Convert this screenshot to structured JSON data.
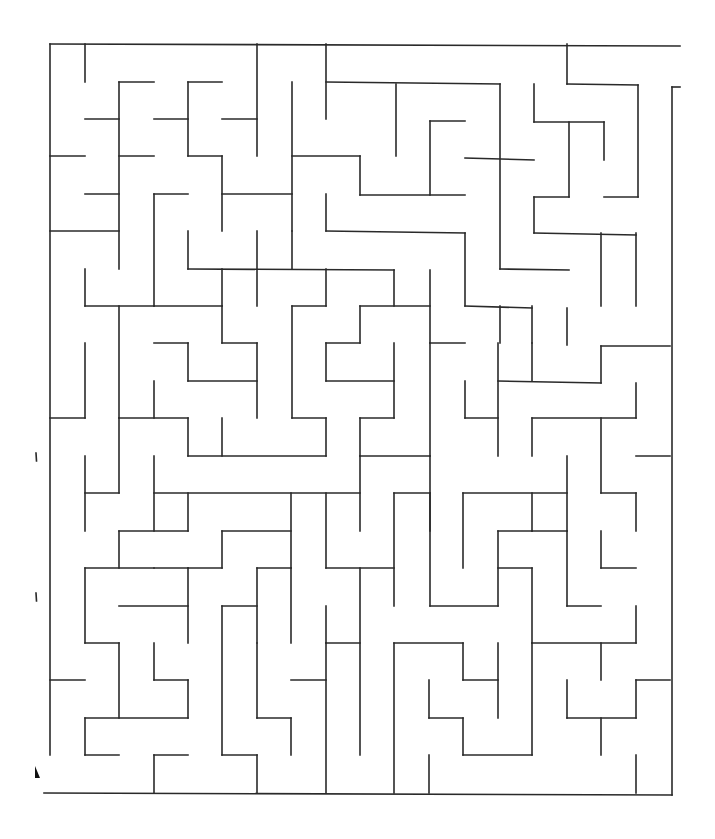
{
  "diagram": {
    "type": "maze",
    "stroke_color": "#2a2a2a",
    "background": "#ffffff",
    "walls": [
      [
        50,
        44,
        680,
        46
      ],
      [
        50,
        44,
        50,
        755
      ],
      [
        44,
        793,
        672,
        795
      ],
      [
        672,
        87,
        672,
        795
      ],
      [
        672,
        87,
        680,
        87
      ],
      [
        85,
        44,
        85,
        82
      ],
      [
        257,
        44,
        257,
        156
      ],
      [
        326,
        44,
        326,
        119
      ],
      [
        567,
        44,
        567,
        84
      ],
      [
        567,
        84,
        638,
        85
      ],
      [
        638,
        85,
        638,
        197
      ],
      [
        119,
        82,
        154,
        82
      ],
      [
        119,
        82,
        119,
        269
      ],
      [
        188,
        82,
        222,
        82
      ],
      [
        188,
        82,
        188,
        156
      ],
      [
        85,
        119,
        119,
        119
      ],
      [
        154,
        119,
        188,
        119
      ],
      [
        222,
        119,
        257,
        119
      ],
      [
        292,
        82,
        292,
        231
      ],
      [
        326,
        82,
        500,
        84
      ],
      [
        396,
        84,
        396,
        156
      ],
      [
        500,
        84,
        500,
        269
      ],
      [
        534,
        84,
        534,
        122
      ],
      [
        534,
        122,
        604,
        122
      ],
      [
        604,
        122,
        604,
        160
      ],
      [
        430,
        121,
        465,
        121
      ],
      [
        430,
        121,
        430,
        195
      ],
      [
        465,
        158,
        534,
        160
      ],
      [
        569,
        122,
        569,
        197
      ],
      [
        534,
        197,
        569,
        197
      ],
      [
        50,
        156,
        85,
        156
      ],
      [
        119,
        156,
        154,
        156
      ],
      [
        188,
        156,
        222,
        156
      ],
      [
        222,
        156,
        222,
        231
      ],
      [
        292,
        156,
        360,
        156
      ],
      [
        360,
        156,
        360,
        195
      ],
      [
        360,
        195,
        465,
        195
      ],
      [
        85,
        194,
        119,
        194
      ],
      [
        154,
        194,
        188,
        194
      ],
      [
        154,
        194,
        154,
        306
      ],
      [
        222,
        194,
        292,
        194
      ],
      [
        326,
        194,
        326,
        231
      ],
      [
        326,
        231,
        465,
        233
      ],
      [
        465,
        233,
        465,
        306
      ],
      [
        534,
        197,
        534,
        233
      ],
      [
        534,
        233,
        636,
        235
      ],
      [
        604,
        197,
        638,
        197
      ],
      [
        601,
        233,
        601,
        306
      ],
      [
        636,
        233,
        636,
        306
      ],
      [
        50,
        231,
        119,
        231
      ],
      [
        188,
        231,
        188,
        269
      ],
      [
        188,
        269,
        394,
        270
      ],
      [
        257,
        231,
        257,
        306
      ],
      [
        222,
        269,
        222,
        306
      ],
      [
        292,
        231,
        292,
        269
      ],
      [
        85,
        269,
        85,
        306
      ],
      [
        394,
        270,
        394,
        306
      ],
      [
        430,
        270,
        430,
        343
      ],
      [
        500,
        269,
        569,
        270
      ],
      [
        85,
        306,
        154,
        306
      ],
      [
        119,
        306,
        119,
        418
      ],
      [
        154,
        306,
        222,
        306
      ],
      [
        222,
        306,
        222,
        343
      ],
      [
        222,
        343,
        257,
        343
      ],
      [
        257,
        343,
        257,
        418
      ],
      [
        292,
        306,
        326,
        306
      ],
      [
        326,
        269,
        326,
        306
      ],
      [
        292,
        306,
        292,
        418
      ],
      [
        292,
        418,
        326,
        418
      ],
      [
        326,
        418,
        326,
        456
      ],
      [
        360,
        306,
        430,
        306
      ],
      [
        360,
        306,
        360,
        343
      ],
      [
        326,
        343,
        360,
        343
      ],
      [
        326,
        343,
        326,
        381
      ],
      [
        326,
        381,
        394,
        381
      ],
      [
        394,
        343,
        394,
        418
      ],
      [
        430,
        343,
        465,
        343
      ],
      [
        465,
        306,
        532,
        308
      ],
      [
        532,
        306,
        532,
        343
      ],
      [
        500,
        306,
        500,
        343
      ],
      [
        154,
        343,
        188,
        343
      ],
      [
        188,
        343,
        188,
        381
      ],
      [
        188,
        381,
        257,
        381
      ],
      [
        154,
        381,
        154,
        418
      ],
      [
        430,
        343,
        430,
        456
      ],
      [
        465,
        381,
        465,
        418
      ],
      [
        465,
        418,
        498,
        418
      ],
      [
        498,
        343,
        498,
        456
      ],
      [
        498,
        381,
        601,
        383
      ],
      [
        532,
        343,
        532,
        381
      ],
      [
        567,
        308,
        567,
        345
      ],
      [
        601,
        346,
        670,
        346
      ],
      [
        601,
        346,
        601,
        383
      ],
      [
        50,
        418,
        85,
        418
      ],
      [
        85,
        343,
        85,
        418
      ],
      [
        119,
        418,
        188,
        418
      ],
      [
        188,
        418,
        188,
        456
      ],
      [
        188,
        456,
        326,
        456
      ],
      [
        222,
        418,
        222,
        456
      ],
      [
        360,
        418,
        394,
        418
      ],
      [
        360,
        418,
        360,
        456
      ],
      [
        532,
        418,
        636,
        418
      ],
      [
        532,
        418,
        532,
        456
      ],
      [
        636,
        383,
        636,
        418
      ],
      [
        601,
        418,
        601,
        493
      ],
      [
        601,
        493,
        636,
        493
      ],
      [
        636,
        493,
        636,
        531
      ],
      [
        636,
        456,
        670,
        456
      ],
      [
        85,
        456,
        85,
        531
      ],
      [
        85,
        493,
        119,
        493
      ],
      [
        119,
        418,
        119,
        493
      ],
      [
        154,
        456,
        154,
        531
      ],
      [
        154,
        493,
        360,
        493
      ],
      [
        360,
        456,
        430,
        456
      ],
      [
        360,
        456,
        360,
        531
      ],
      [
        430,
        456,
        430,
        531
      ],
      [
        119,
        531,
        188,
        531
      ],
      [
        119,
        531,
        119,
        568
      ],
      [
        154,
        568,
        188,
        568
      ],
      [
        188,
        493,
        188,
        531
      ],
      [
        222,
        531,
        291,
        531
      ],
      [
        222,
        531,
        222,
        568
      ],
      [
        291,
        493,
        291,
        568
      ],
      [
        326,
        493,
        326,
        568
      ],
      [
        394,
        493,
        430,
        493
      ],
      [
        394,
        493,
        394,
        606
      ],
      [
        430,
        493,
        430,
        606
      ],
      [
        430,
        606,
        498,
        606
      ],
      [
        463,
        493,
        567,
        493
      ],
      [
        463,
        493,
        463,
        568
      ],
      [
        498,
        531,
        532,
        531
      ],
      [
        498,
        531,
        498,
        606
      ],
      [
        532,
        493,
        532,
        531
      ],
      [
        567,
        456,
        567,
        531
      ],
      [
        532,
        531,
        567,
        531
      ],
      [
        567,
        531,
        567,
        606
      ],
      [
        601,
        531,
        601,
        568
      ],
      [
        567,
        606,
        601,
        606
      ],
      [
        601,
        568,
        636,
        568
      ],
      [
        85,
        568,
        154,
        568
      ],
      [
        85,
        568,
        85,
        643
      ],
      [
        85,
        643,
        119,
        643
      ],
      [
        119,
        606,
        188,
        606
      ],
      [
        119,
        643,
        119,
        718
      ],
      [
        188,
        568,
        188,
        643
      ],
      [
        188,
        568,
        222,
        568
      ],
      [
        222,
        606,
        257,
        606
      ],
      [
        257,
        568,
        257,
        643
      ],
      [
        257,
        568,
        291,
        568
      ],
      [
        291,
        568,
        291,
        643
      ],
      [
        326,
        568,
        394,
        568
      ],
      [
        360,
        568,
        360,
        755
      ],
      [
        326,
        606,
        326,
        643
      ],
      [
        498,
        568,
        532,
        568
      ],
      [
        532,
        568,
        532,
        643
      ],
      [
        532,
        643,
        636,
        643
      ],
      [
        601,
        643,
        601,
        680
      ],
      [
        636,
        606,
        636,
        643
      ],
      [
        154,
        643,
        154,
        680
      ],
      [
        154,
        680,
        188,
        680
      ],
      [
        188,
        680,
        188,
        718
      ],
      [
        85,
        718,
        188,
        718
      ],
      [
        85,
        718,
        85,
        755
      ],
      [
        85,
        755,
        119,
        755
      ],
      [
        222,
        606,
        222,
        755
      ],
      [
        222,
        755,
        257,
        755
      ],
      [
        257,
        643,
        257,
        718
      ],
      [
        257,
        718,
        291,
        718
      ],
      [
        291,
        718,
        291,
        755
      ],
      [
        291,
        680,
        326,
        680
      ],
      [
        326,
        643,
        360,
        643
      ],
      [
        326,
        643,
        326,
        793
      ],
      [
        394,
        643,
        463,
        643
      ],
      [
        394,
        643,
        394,
        793
      ],
      [
        463,
        643,
        463,
        680
      ],
      [
        463,
        680,
        498,
        680
      ],
      [
        498,
        643,
        498,
        718
      ],
      [
        429,
        680,
        429,
        718
      ],
      [
        429,
        718,
        463,
        718
      ],
      [
        463,
        718,
        463,
        755
      ],
      [
        463,
        755,
        532,
        755
      ],
      [
        532,
        643,
        532,
        755
      ],
      [
        567,
        680,
        567,
        718
      ],
      [
        567,
        718,
        636,
        718
      ],
      [
        601,
        718,
        601,
        755
      ],
      [
        636,
        680,
        670,
        680
      ],
      [
        636,
        680,
        636,
        718
      ],
      [
        50,
        680,
        85,
        680
      ],
      [
        154,
        755,
        188,
        755
      ],
      [
        154,
        755,
        154,
        793
      ],
      [
        257,
        755,
        257,
        793
      ],
      [
        429,
        755,
        429,
        793
      ],
      [
        636,
        755,
        636,
        793
      ]
    ],
    "markers": [
      {
        "x": 36,
        "y": 457,
        "shape": "tick"
      },
      {
        "x": 36,
        "y": 597,
        "shape": "tick"
      },
      {
        "x": 35,
        "y": 772,
        "shape": "arrowhead"
      }
    ]
  }
}
